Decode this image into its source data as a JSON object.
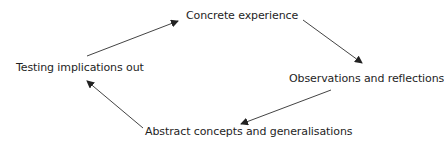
{
  "diagram": {
    "type": "cycle",
    "nodes": [
      {
        "id": "concrete",
        "label": "Concrete experience"
      },
      {
        "id": "observations",
        "label": "Observations and reflections"
      },
      {
        "id": "abstract",
        "label": "Abstract concepts and generalisations"
      },
      {
        "id": "testing",
        "label": "Testing implications out"
      }
    ],
    "edges": [
      {
        "from": "concrete",
        "to": "observations"
      },
      {
        "from": "observations",
        "to": "abstract"
      },
      {
        "from": "abstract",
        "to": "testing"
      },
      {
        "from": "testing",
        "to": "concrete"
      }
    ],
    "colors": {
      "text": "#1e1e1e",
      "arrow": "#333333",
      "background": "#ffffff"
    }
  }
}
